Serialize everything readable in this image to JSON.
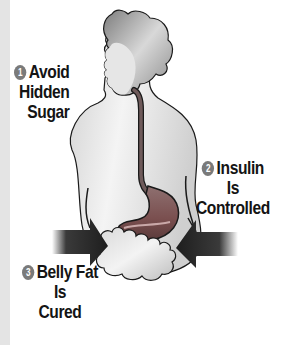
{
  "figure": {
    "colors": {
      "background": "#ffffff",
      "left_strip": "#e4e4e4",
      "body_fill": "#e9e9e9",
      "hair": "#8c8c8c",
      "outline": "#1a1a1a",
      "esophagus": "#6e5a5a",
      "stomach": "#8a5c5c",
      "belly_fat": "#e6e6e6",
      "arrow": "#262626",
      "badge": "#7a7a7a",
      "text": "#141414"
    }
  },
  "labels": [
    {
      "number": "1",
      "lines": [
        "Avoid",
        "Hidden",
        "Sugar"
      ]
    },
    {
      "number": "2",
      "lines": [
        "Insulin",
        "Is",
        "Controlled"
      ]
    },
    {
      "number": "3",
      "lines": [
        "Belly Fat",
        "Is",
        "Cured"
      ]
    }
  ]
}
